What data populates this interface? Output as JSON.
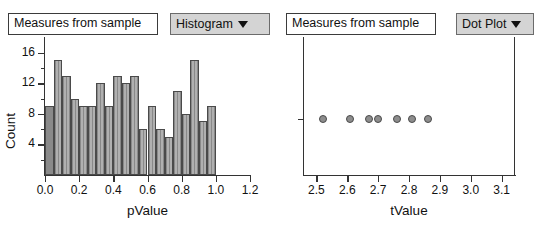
{
  "panels": [
    {
      "attribute_label": "Measures from sample",
      "plot_menu": "Histogram",
      "menu_icon": "chevron-down-icon"
    },
    {
      "attribute_label": "Measures from sample",
      "plot_menu": "Dot Plot",
      "menu_icon": "chevron-down-icon"
    }
  ],
  "chart_data": [
    {
      "type": "bar",
      "title": "",
      "xlabel": "pValue",
      "ylabel": "Count",
      "xlim": [
        0.0,
        1.2
      ],
      "ylim": [
        0,
        17
      ],
      "xticks": [
        "0.0",
        "0.2",
        "0.4",
        "0.6",
        "0.8",
        "1.0",
        "1.2"
      ],
      "xtick_values": [
        0.0,
        0.2,
        0.4,
        0.6,
        0.8,
        1.0,
        1.2
      ],
      "yticks": [
        "4",
        "8",
        "12",
        "16"
      ],
      "ytick_values": [
        4,
        8,
        12,
        16
      ],
      "minor_yticks": [
        2,
        6,
        10,
        14
      ],
      "bin_width": 0.05,
      "bin_starts": [
        0.0,
        0.05,
        0.1,
        0.15,
        0.2,
        0.25,
        0.3,
        0.35,
        0.4,
        0.45,
        0.5,
        0.55,
        0.6,
        0.65,
        0.7,
        0.75,
        0.8,
        0.85,
        0.9,
        0.95
      ],
      "categories": [
        "0.00-0.05",
        "0.05-0.10",
        "0.10-0.15",
        "0.15-0.20",
        "0.20-0.25",
        "0.25-0.30",
        "0.30-0.35",
        "0.35-0.40",
        "0.40-0.45",
        "0.45-0.50",
        "0.50-0.55",
        "0.55-0.60",
        "0.60-0.65",
        "0.65-0.70",
        "0.70-0.75",
        "0.75-0.80",
        "0.80-0.85",
        "0.85-0.90",
        "0.90-0.95",
        "0.95-1.00"
      ],
      "values": [
        9,
        15,
        13,
        10,
        9,
        9,
        12,
        9,
        13,
        12,
        13,
        6,
        9,
        6,
        5,
        11,
        8,
        15,
        7,
        9
      ],
      "selected_bins": [
        0
      ],
      "grid": false,
      "legend": false
    },
    {
      "type": "scatter",
      "title": "",
      "xlabel": "tValue",
      "ylabel": "",
      "xlim": [
        2.46,
        3.14
      ],
      "xticks": [
        "2.5",
        "2.6",
        "2.7",
        "2.8",
        "2.9",
        "3.0",
        "3.1"
      ],
      "xtick_values": [
        2.5,
        2.6,
        2.7,
        2.8,
        2.9,
        3.0,
        3.1
      ],
      "x": [
        2.52,
        2.61,
        2.67,
        2.7,
        2.76,
        2.81,
        2.86
      ],
      "y": [
        0,
        0,
        0,
        0,
        0,
        0,
        0
      ],
      "point_count": 7,
      "grid": false,
      "legend": false
    }
  ]
}
